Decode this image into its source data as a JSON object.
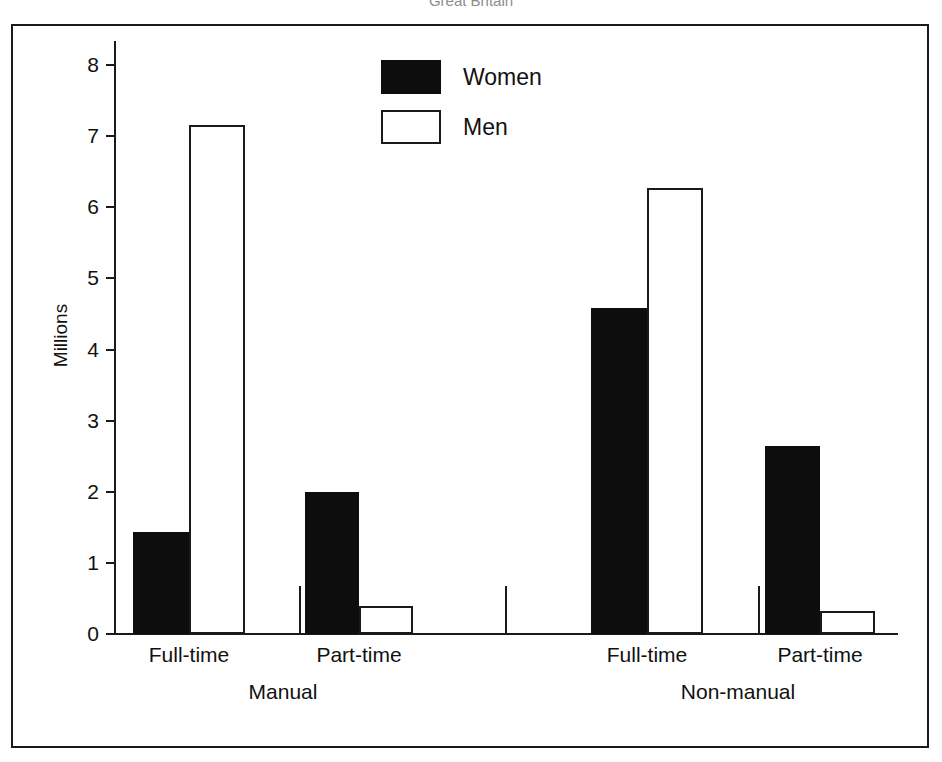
{
  "figure": {
    "title_clipped": "Great Britain"
  },
  "legend": {
    "position": "top-center-inside",
    "entries": [
      {
        "label": "Women",
        "swatch": "filled-black-square"
      },
      {
        "label": "Men",
        "swatch": "hollow-white-square"
      }
    ]
  },
  "axes": {
    "ylabel": "Millions",
    "xlabel": "",
    "yticks": [
      "0",
      "1",
      "2",
      "3",
      "4",
      "5",
      "6",
      "7",
      "8"
    ],
    "ylim": [
      0,
      8
    ],
    "grid": false
  },
  "groups": [
    {
      "name": "Manual",
      "subgroups": [
        "Full-time",
        "Part-time"
      ]
    },
    {
      "name": "Non-manual",
      "subgroups": [
        "Full-time",
        "Part-time"
      ]
    }
  ],
  "chart_data": {
    "type": "bar",
    "title": "Great Britain",
    "xlabel": "",
    "ylabel": "Millions",
    "ylim": [
      0,
      8
    ],
    "yticks": [
      0,
      1,
      2,
      3,
      4,
      5,
      6,
      7,
      8
    ],
    "grid": false,
    "legend_position": "top-center",
    "categories": [
      "Manual / Full-time",
      "Manual / Part-time",
      "Non-manual / Full-time",
      "Non-manual / Part-time"
    ],
    "group_labels": [
      "Manual",
      "Non-manual"
    ],
    "subgroup_labels": [
      "Full-time",
      "Part-time",
      "Full-time",
      "Part-time"
    ],
    "series": [
      {
        "name": "Women",
        "color": "#0d0d0d",
        "values": [
          1.43,
          2.0,
          4.58,
          2.65
        ]
      },
      {
        "name": "Men",
        "color": "#ffffff",
        "values": [
          7.15,
          0.4,
          6.27,
          0.33
        ]
      }
    ]
  },
  "bars": [
    {
      "series": "Women",
      "group": "Manual",
      "sub": "Full-time",
      "value": 1.43,
      "x": 120,
      "w": 56
    },
    {
      "series": "Men",
      "group": "Manual",
      "sub": "Full-time",
      "value": 7.15,
      "x": 176,
      "w": 56
    },
    {
      "series": "Women",
      "group": "Manual",
      "sub": "Part-time",
      "value": 2.0,
      "x": 292,
      "w": 54
    },
    {
      "series": "Men",
      "group": "Manual",
      "sub": "Part-time",
      "value": 0.4,
      "x": 346,
      "w": 54
    },
    {
      "series": "Women",
      "group": "Non-manual",
      "sub": "Full-time",
      "value": 4.58,
      "x": 578,
      "w": 56
    },
    {
      "series": "Men",
      "group": "Non-manual",
      "sub": "Full-time",
      "value": 6.27,
      "x": 634,
      "w": 56
    },
    {
      "series": "Women",
      "group": "Non-manual",
      "sub": "Part-time",
      "value": 2.65,
      "x": 752,
      "w": 55
    },
    {
      "series": "Men",
      "group": "Non-manual",
      "sub": "Part-time",
      "value": 0.33,
      "x": 807,
      "w": 55
    }
  ],
  "x_labels": [
    {
      "text": "Full-time",
      "center": 176
    },
    {
      "text": "Part-time",
      "center": 346
    },
    {
      "text": "Full-time",
      "center": 634
    },
    {
      "text": "Part-time",
      "center": 807
    }
  ],
  "group_labels": [
    {
      "text": "Manual",
      "center": 270
    },
    {
      "text": "Non-manual",
      "center": 725
    }
  ],
  "separators": [
    286,
    492,
    745
  ],
  "colors": {
    "women": "#0d0d0d",
    "men": "#ffffff",
    "axis": "#1a1a1a",
    "text": "#111111",
    "background": "#ffffff"
  }
}
